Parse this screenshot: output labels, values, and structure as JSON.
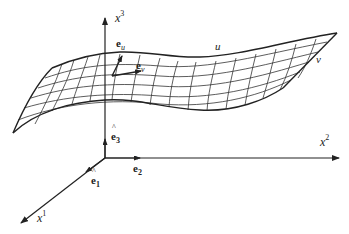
{
  "diagram": {
    "type": "surface-coordinate-basis",
    "colors": {
      "line": "#222222",
      "background": "#ffffff"
    },
    "axes": [
      {
        "id": "x1",
        "label": "x",
        "superscript": "1"
      },
      {
        "id": "x2",
        "label": "x",
        "superscript": "2"
      },
      {
        "id": "x3",
        "label": "x",
        "superscript": "3"
      }
    ],
    "basis_vectors": [
      {
        "id": "e1",
        "label": "ê",
        "subscript": "1"
      },
      {
        "id": "e2",
        "label": "ê",
        "subscript": "2"
      },
      {
        "id": "e3",
        "label": "ê",
        "subscript": "3"
      }
    ],
    "tangent_vectors": [
      {
        "id": "eu",
        "label": "e",
        "subscript": "u"
      },
      {
        "id": "ev",
        "label": "e",
        "subscript": "v"
      }
    ],
    "surface_parameters": {
      "u": "u",
      "v": "v"
    }
  }
}
